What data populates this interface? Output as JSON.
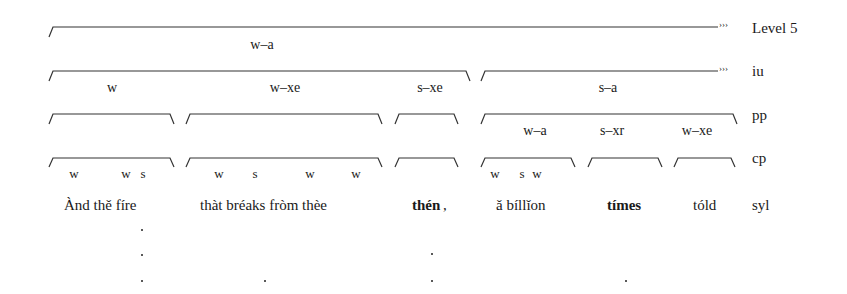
{
  "levels": {
    "level5": "Level 5",
    "iu": "iu",
    "pp": "pp",
    "cp": "cp",
    "syl": "syl"
  },
  "continuation_marker": "›››",
  "level5_labels": [
    "w–a"
  ],
  "iu_labels": [
    "w",
    "w–xe",
    "s–xe",
    "s–a"
  ],
  "pp_labels": [
    "w–a",
    "s–xr",
    "w–xe"
  ],
  "cp_marks": [
    "w",
    "w",
    "s",
    "w",
    "s",
    "w",
    "w",
    "w",
    "s",
    "w"
  ],
  "syllables": [
    {
      "text": "Ànd thě fíre",
      "bold": false
    },
    {
      "text": "thàt bréaks fròm thèe",
      "bold": false
    },
    {
      "text": "thén",
      "bold": true
    },
    {
      "text": ",",
      "bold": false
    },
    {
      "text": "ǎ bíllǐon",
      "bold": false
    },
    {
      "text": "tímes",
      "bold": true
    },
    {
      "text": "tóld",
      "bold": false
    }
  ]
}
